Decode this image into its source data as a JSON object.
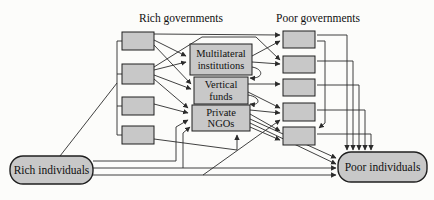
{
  "diagram": {
    "colors": {
      "background": "#fcfcfa",
      "node_fill": "#c8c8c8",
      "node_stroke": "#1f1f1f",
      "line": "#2b2b2b",
      "text": "#101010"
    },
    "headings": [
      {
        "id": "rich-governments-heading",
        "text": "Rich governments",
        "x": 181,
        "y": 22
      },
      {
        "id": "poor-governments-heading",
        "text": "Poor governments",
        "x": 318,
        "y": 22
      }
    ],
    "nodes": [
      {
        "id": "rich-gov-box-1",
        "shape": "rect",
        "x": 122,
        "y": 32,
        "w": 32,
        "h": 18,
        "lines": []
      },
      {
        "id": "rich-gov-box-2",
        "shape": "rect",
        "x": 122,
        "y": 64,
        "w": 32,
        "h": 20,
        "lines": []
      },
      {
        "id": "rich-gov-box-3",
        "shape": "rect",
        "x": 122,
        "y": 97,
        "w": 32,
        "h": 18,
        "lines": []
      },
      {
        "id": "rich-gov-box-4",
        "shape": "rect",
        "x": 122,
        "y": 126,
        "w": 32,
        "h": 18,
        "lines": []
      },
      {
        "id": "multilateral-institutions",
        "shape": "rect",
        "x": 190,
        "y": 44,
        "w": 62,
        "h": 31,
        "lines": [
          "Multilateral",
          "institutions"
        ]
      },
      {
        "id": "vertical-funds",
        "shape": "rect",
        "x": 194,
        "y": 77,
        "w": 54,
        "h": 27,
        "lines": [
          "Vertical",
          "funds"
        ]
      },
      {
        "id": "private-ngos",
        "shape": "rect",
        "x": 192,
        "y": 105,
        "w": 58,
        "h": 26,
        "lines": [
          "Private",
          "NGOs"
        ]
      },
      {
        "id": "poor-gov-box-1",
        "shape": "rect",
        "x": 283,
        "y": 31,
        "w": 32,
        "h": 17,
        "lines": []
      },
      {
        "id": "poor-gov-box-2",
        "shape": "rect",
        "x": 283,
        "y": 56,
        "w": 32,
        "h": 17,
        "lines": []
      },
      {
        "id": "poor-gov-box-3",
        "shape": "rect",
        "x": 283,
        "y": 79,
        "w": 32,
        "h": 17,
        "lines": []
      },
      {
        "id": "poor-gov-box-4",
        "shape": "rect",
        "x": 283,
        "y": 103,
        "w": 32,
        "h": 18,
        "lines": []
      },
      {
        "id": "poor-gov-box-5",
        "shape": "rect",
        "x": 283,
        "y": 127,
        "w": 32,
        "h": 18,
        "lines": []
      },
      {
        "id": "rich-individuals",
        "shape": "round",
        "x": 10,
        "y": 156,
        "w": 83,
        "h": 28,
        "lines": [
          "Rich individuals"
        ]
      },
      {
        "id": "poor-individuals",
        "shape": "round",
        "x": 338,
        "y": 152,
        "w": 89,
        "h": 30,
        "lines": [
          "Poor individuals"
        ]
      }
    ],
    "edges": [
      {
        "id": "rich-gov-spine",
        "points": [
          [
            117,
            41
          ],
          [
            117,
            135
          ]
        ],
        "arrow": false
      },
      {
        "id": "spine-stub-1",
        "points": [
          [
            117,
            41
          ],
          [
            123,
            41
          ]
        ],
        "arrow": false
      },
      {
        "id": "spine-stub-2",
        "points": [
          [
            117,
            74
          ],
          [
            123,
            74
          ]
        ],
        "arrow": false
      },
      {
        "id": "spine-stub-3",
        "points": [
          [
            117,
            106
          ],
          [
            123,
            106
          ]
        ],
        "arrow": false
      },
      {
        "id": "spine-stub-4",
        "points": [
          [
            117,
            135
          ],
          [
            123,
            135
          ]
        ],
        "arrow": false
      },
      {
        "id": "rich-individuals-to-spine",
        "points": [
          [
            60,
            156
          ],
          [
            117,
            83
          ]
        ],
        "arrow": false
      },
      {
        "id": "rg1-to-pg1",
        "points": [
          [
            154,
            34
          ],
          [
            280,
            35
          ]
        ],
        "arrow": true
      },
      {
        "id": "rg1-to-multilateral",
        "points": [
          [
            154,
            40
          ],
          [
            186,
            56
          ]
        ],
        "arrow": true
      },
      {
        "id": "rg1-to-vertical",
        "points": [
          [
            154,
            45
          ],
          [
            191,
            84
          ]
        ],
        "arrow": true
      },
      {
        "id": "rg2-to-pg2",
        "points": [
          [
            154,
            67
          ],
          [
            202,
            37
          ],
          [
            256,
            37
          ],
          [
            280,
            60
          ]
        ],
        "arrow": true
      },
      {
        "id": "rg2-to-multilateral",
        "points": [
          [
            154,
            70
          ],
          [
            186,
            62
          ]
        ],
        "arrow": true
      },
      {
        "id": "rg2-to-vertical",
        "points": [
          [
            154,
            75
          ],
          [
            191,
            89
          ]
        ],
        "arrow": true
      },
      {
        "id": "rg2-to-ngos",
        "points": [
          [
            154,
            79
          ],
          [
            188,
            108
          ]
        ],
        "arrow": true
      },
      {
        "id": "rg3-to-ngos",
        "points": [
          [
            154,
            104
          ],
          [
            188,
            113
          ]
        ],
        "arrow": true
      },
      {
        "id": "rg4-to-ngos-bottom",
        "points": [
          [
            154,
            139
          ],
          [
            237,
            150
          ],
          [
            237,
            135
          ]
        ],
        "arrow": true
      },
      {
        "id": "multilateral-to-pg1",
        "points": [
          [
            252,
            56
          ],
          [
            280,
            41
          ]
        ],
        "arrow": true
      },
      {
        "id": "multilateral-to-pg2",
        "points": [
          [
            252,
            62
          ],
          [
            280,
            64
          ]
        ],
        "arrow": true
      },
      {
        "id": "multilateral-to-vertical-hook",
        "path": "M252,67 C264,69 264,79 250,78",
        "arrow": true
      },
      {
        "id": "vertical-to-pg3",
        "points": [
          [
            248,
            84
          ],
          [
            280,
            84
          ]
        ],
        "arrow": true
      },
      {
        "id": "vertical-to-pg4",
        "points": [
          [
            248,
            92
          ],
          [
            280,
            108
          ]
        ],
        "arrow": true
      },
      {
        "id": "vertical-to-ngos-hook",
        "path": "M248,95 C261,97 261,106 250,104",
        "arrow": true
      },
      {
        "id": "ngos-to-pg4",
        "points": [
          [
            250,
            110
          ],
          [
            280,
            113
          ]
        ],
        "arrow": true
      },
      {
        "id": "ngos-to-pg5-a",
        "points": [
          [
            250,
            114
          ],
          [
            280,
            131
          ]
        ],
        "arrow": true
      },
      {
        "id": "ngos-to-pg5-b",
        "points": [
          [
            250,
            127
          ],
          [
            280,
            140
          ]
        ],
        "arrow": true
      },
      {
        "id": "ngos-to-poor-individuals-a",
        "points": [
          [
            250,
            119
          ],
          [
            336,
            158
          ]
        ],
        "arrow": true
      },
      {
        "id": "ngos-to-poor-individuals-b",
        "points": [
          [
            250,
            123
          ],
          [
            336,
            164
          ]
        ],
        "arrow": true
      },
      {
        "id": "rich-individuals-to-ngos-left",
        "points": [
          [
            93,
            161
          ],
          [
            176,
            161
          ],
          [
            176,
            127
          ],
          [
            188,
            120
          ]
        ],
        "arrow": true
      },
      {
        "id": "rich-individuals-to-poor-individuals-a",
        "points": [
          [
            93,
            168
          ],
          [
            336,
            168
          ]
        ],
        "arrow": true
      },
      {
        "id": "rich-individuals-branch-to-ngos",
        "points": [
          [
            183,
            168
          ],
          [
            183,
            133
          ],
          [
            190,
            127
          ]
        ],
        "arrow": true
      },
      {
        "id": "rich-individuals-to-poor-individuals-b",
        "points": [
          [
            93,
            175
          ],
          [
            336,
            175
          ]
        ],
        "arrow": true
      },
      {
        "id": "rich-individuals-to-pg4-diagonal",
        "points": [
          [
            203,
            175
          ],
          [
            280,
            120
          ]
        ],
        "arrow": true
      },
      {
        "id": "pg1-down-to-poor-individuals",
        "points": [
          [
            317,
            35
          ],
          [
            347,
            35
          ],
          [
            347,
            150
          ]
        ],
        "arrow": true
      },
      {
        "id": "pg2-down-to-poor-individuals",
        "points": [
          [
            317,
            61
          ],
          [
            353,
            61
          ],
          [
            353,
            150
          ]
        ],
        "arrow": true
      },
      {
        "id": "pg3-down-to-poor-individuals",
        "points": [
          [
            317,
            85
          ],
          [
            359,
            85
          ],
          [
            359,
            150
          ]
        ],
        "arrow": true
      },
      {
        "id": "pg4-down-to-poor-individuals",
        "points": [
          [
            317,
            110
          ],
          [
            365,
            110
          ],
          [
            365,
            150
          ]
        ],
        "arrow": true
      },
      {
        "id": "pg5-down-to-poor-individuals",
        "points": [
          [
            317,
            134
          ],
          [
            371,
            134
          ],
          [
            371,
            150
          ]
        ],
        "arrow": true
      },
      {
        "id": "pg1-to-pg5-inner",
        "points": [
          [
            317,
            41
          ],
          [
            325,
            41
          ],
          [
            325,
            123
          ],
          [
            319,
            128
          ]
        ],
        "arrow": true
      }
    ]
  }
}
